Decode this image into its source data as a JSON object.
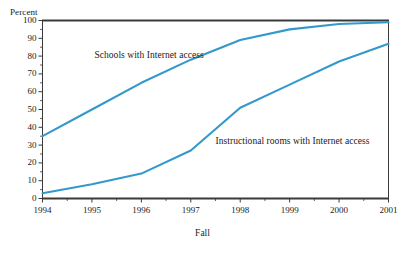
{
  "chart_data": {
    "type": "line",
    "title": "",
    "subtitle": "",
    "xlabel": "Fall",
    "ylabel": "Percent",
    "categories": [
      "1994",
      "1995",
      "1996",
      "1997",
      "1998",
      "1999",
      "2000",
      "2001"
    ],
    "x": [
      1994,
      1995,
      1996,
      1997,
      1998,
      1999,
      2000,
      2001
    ],
    "xlim": [
      1994,
      2001
    ],
    "ylim": [
      0,
      100
    ],
    "yticks": [
      0,
      10,
      20,
      30,
      40,
      50,
      60,
      70,
      80,
      90,
      100
    ],
    "ytick_labels": [
      "0",
      "10",
      "20",
      "30",
      "40",
      "50",
      "60",
      "70",
      "80",
      "90",
      "100"
    ],
    "xtick_labels": [
      "1994",
      "1995",
      "1996",
      "1997",
      "1998",
      "1999",
      "2000",
      "2001"
    ],
    "minor_ticks": true,
    "grid": false,
    "legend_position": "inline-annotation",
    "series": [
      {
        "name": "Schools with Internet access",
        "color": "#3399CC",
        "values": [
          35,
          50,
          65,
          78,
          89,
          95,
          98,
          99
        ]
      },
      {
        "name": "Instructional rooms with Internet access",
        "color": "#3399CC",
        "values": [
          3,
          8,
          14,
          27,
          51,
          64,
          77,
          87
        ]
      }
    ],
    "annotations": [
      {
        "text": "Schools with Internet access",
        "x": 1995.05,
        "y": 80
      },
      {
        "text": "Instructional rooms with Internet access",
        "x": 1997.5,
        "y": 32
      }
    ]
  },
  "axis": {
    "ylabel": "Percent",
    "xlabel": "Fall"
  },
  "colors": {
    "line": "#3399CC",
    "frame": "#3a3a3a",
    "text": "#1a1a1a",
    "background": "#ffffff"
  }
}
